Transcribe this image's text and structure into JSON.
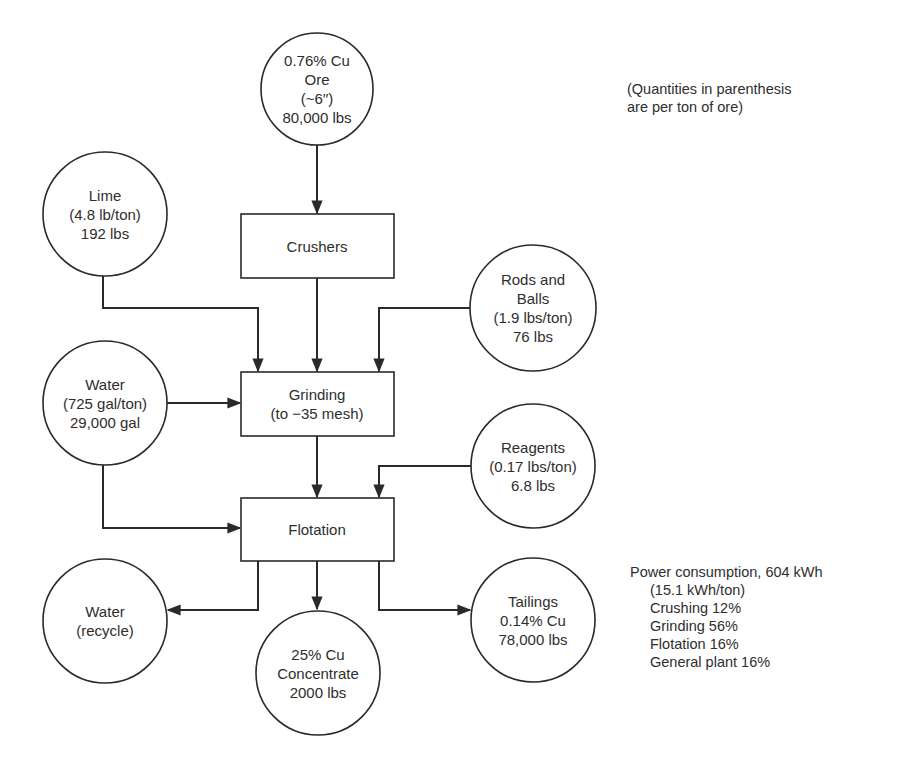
{
  "diagram": {
    "note": {
      "line1": "(Quantities in parenthesis",
      "line2": "are per ton of ore)"
    },
    "inputs": {
      "ore": {
        "line1": "0.76% Cu",
        "line2": "Ore",
        "line3": "(~6′′)",
        "line4": "80,000 lbs"
      },
      "lime": {
        "line1": "Lime",
        "line2": "(4.8 lb/ton)",
        "line3": "192 lbs"
      },
      "rods_balls": {
        "line1": "Rods and",
        "line2": "Balls",
        "line3": "(1.9 lbs/ton)",
        "line4": "76 lbs"
      },
      "water": {
        "line1": "Water",
        "line2": "(725 gal/ton)",
        "line3": "29,000 gal"
      },
      "reagents": {
        "line1": "Reagents",
        "line2": "(0.17 lbs/ton)",
        "line3": "6.8 lbs"
      }
    },
    "processes": {
      "crushers": {
        "line1": "Crushers"
      },
      "grinding": {
        "line1": "Grinding",
        "line2": "(to −35 mesh)"
      },
      "flotation": {
        "line1": "Flotation"
      }
    },
    "outputs": {
      "water_recycle": {
        "line1": "Water",
        "line2": "(recycle)"
      },
      "concentrate": {
        "line1": "25% Cu",
        "line2": "Concentrate",
        "line3": "2000 lbs"
      },
      "tailings": {
        "line1": "Tailings",
        "line2": "0.14% Cu",
        "line3": "78,000 lbs"
      }
    },
    "power": {
      "header": "Power consumption, 604 kWh",
      "per_ton": "(15.1 kWh/ton)",
      "items": [
        {
          "label": "Crushing 12%"
        },
        {
          "label": "Grinding 56%"
        },
        {
          "label": "Flotation 16%"
        },
        {
          "label": "General plant 16%"
        }
      ]
    },
    "colors": {
      "line": "#2a2a2a",
      "background": "#ffffff"
    }
  }
}
